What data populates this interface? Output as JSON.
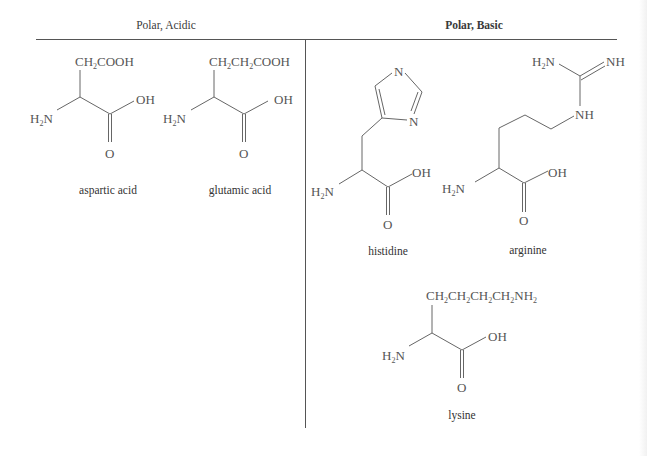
{
  "table": {
    "columns": [
      {
        "header": "Polar, Acidic",
        "bold": false
      },
      {
        "header": "Polar, Basic",
        "bold": true
      }
    ]
  },
  "molecules": {
    "aspartic_acid": {
      "name": "aspartic acid",
      "side_chain": [
        "CH",
        "2",
        "COOH"
      ],
      "amine": [
        "H",
        "2",
        "N"
      ],
      "hydroxyl": "OH",
      "carbonyl": "O"
    },
    "glutamic_acid": {
      "name": "glutamic acid",
      "side_chain": [
        "CH",
        "2",
        "CH",
        "2",
        "COOH"
      ],
      "amine": [
        "H",
        "2",
        "N"
      ],
      "hydroxyl": "OH",
      "carbonyl": "O"
    },
    "histidine": {
      "name": "histidine",
      "ring_n1": "N",
      "ring_n2": "N",
      "amine": [
        "H",
        "2",
        "N"
      ],
      "hydroxyl": "OH",
      "carbonyl": "O"
    },
    "arginine": {
      "name": "arginine",
      "guanidine_amine": [
        "H",
        "2",
        "N"
      ],
      "imine": "NH",
      "nh_link": "NH",
      "amine": [
        "H",
        "2",
        "N"
      ],
      "hydroxyl": "OH",
      "carbonyl": "O"
    },
    "lysine": {
      "name": "lysine",
      "side_chain": [
        "CH",
        "2",
        "CH",
        "2",
        "CH",
        "2",
        "CH",
        "2",
        "NH",
        "2"
      ],
      "amine": [
        "H",
        "2",
        "N"
      ],
      "hydroxyl": "OH",
      "carbonyl": "O"
    }
  }
}
